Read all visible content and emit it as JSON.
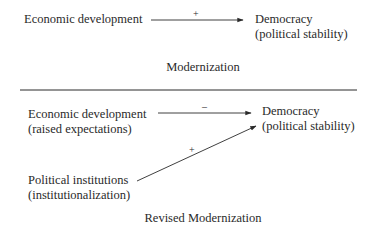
{
  "top_panel": {
    "source": {
      "line1": "Economic development"
    },
    "target": {
      "line1": "Democracy",
      "line2": "(political stability)"
    },
    "arrow_sign": "+",
    "caption": "Modernization"
  },
  "bottom_panel": {
    "source_econ": {
      "line1": "Economic development",
      "line2": "(raised expectations)"
    },
    "source_inst": {
      "line1": "Political institutions",
      "line2": "(institutionalization)"
    },
    "target": {
      "line1": "Democracy",
      "line2": "(political stability)"
    },
    "arrow_econ_sign": "–",
    "arrow_inst_sign": "+",
    "caption": "Revised Modernization"
  },
  "colors": {
    "ink": "#2a2a2a",
    "background": "#ffffff"
  }
}
